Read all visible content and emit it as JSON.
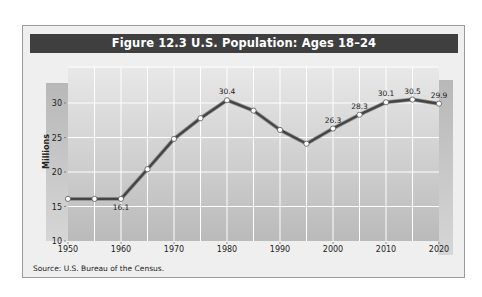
{
  "figure": {
    "title": "Figure 12.3  U.S. Population: Ages 18–24",
    "source": "Source: U.S. Bureau of the Census."
  },
  "colors": {
    "title_bar": "#3f3f3f",
    "frame_bg": "#efefef",
    "plot_bg_top": "#e6e6e6",
    "plot_bg_bottom": "#bdbdbd",
    "side_bar": "#c2c2c2",
    "line": "#4a4a4a",
    "marker_fill": "#ffffff",
    "grid": "#ffffff"
  },
  "chart_data": {
    "type": "line",
    "title": "Figure 12.3  U.S. Population: Ages 18–24",
    "xlabel": "",
    "ylabel": "Millions",
    "x": [
      1950,
      1955,
      1960,
      1965,
      1970,
      1975,
      1980,
      1985,
      1990,
      1995,
      2000,
      2005,
      2010,
      2015,
      2020
    ],
    "series": [
      {
        "name": "Ages 18–24",
        "values": [
          16.1,
          16.1,
          16.1,
          20.4,
          24.8,
          27.8,
          30.4,
          28.9,
          26.1,
          24.1,
          26.3,
          28.3,
          30.1,
          30.5,
          29.9
        ]
      }
    ],
    "data_labels": [
      {
        "x": 1960,
        "label": "16.1",
        "position": "below"
      },
      {
        "x": 1980,
        "label": "30.4",
        "position": "above"
      },
      {
        "x": 2000,
        "label": "26.3",
        "position": "above"
      },
      {
        "x": 2005,
        "label": "28.3",
        "position": "above"
      },
      {
        "x": 2010,
        "label": "30.1",
        "position": "above"
      },
      {
        "x": 2015,
        "label": "30.5",
        "position": "above"
      },
      {
        "x": 2020,
        "label": "29.9",
        "position": "above"
      }
    ],
    "xticks": [
      "1950",
      "1960",
      "1970",
      "1980",
      "1990",
      "2000",
      "2010",
      "2020"
    ],
    "yticks": [
      "10",
      "15",
      "20",
      "25",
      "30"
    ],
    "ylim": [
      10,
      33
    ],
    "xlim": [
      1950,
      2020
    ],
    "grid": true,
    "legend": "none",
    "source": "Source: U.S. Bureau of the Census."
  }
}
